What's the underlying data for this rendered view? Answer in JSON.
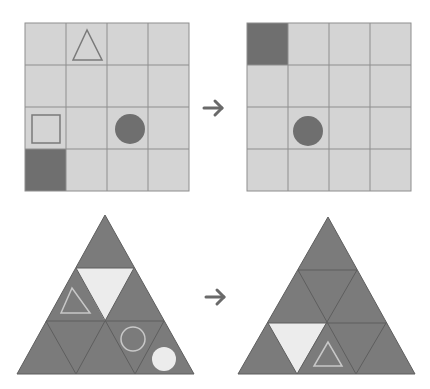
{
  "colors": {
    "background": "#ffffff",
    "grid_cell": "#d4d4d4",
    "grid_line": "#8e8e8e",
    "dark_fill": "#6f6f6f",
    "shape_outline": "#7a7a7a",
    "tri_fill": "#7b7b7b",
    "tri_line": "#5e5e5e",
    "light_fill": "#ececec",
    "light_outline": "#c8c8c8",
    "arrow": "#6a6a6a"
  },
  "top_row": {
    "before": {
      "grid_size": 4,
      "items": [
        {
          "type": "triangle-outline",
          "row": 0,
          "col": 1
        },
        {
          "type": "square-outline",
          "row": 2,
          "col": 0
        },
        {
          "type": "circle-filled",
          "row": 2,
          "col": 2
        },
        {
          "type": "cell-filled",
          "row": 3,
          "col": 0
        }
      ]
    },
    "after": {
      "grid_size": 4,
      "items": [
        {
          "type": "cell-filled",
          "row": 0,
          "col": 0
        },
        {
          "type": "circle-filled",
          "row": 2,
          "col": 1
        }
      ]
    },
    "arrow": "right-arrow"
  },
  "bottom_row": {
    "before": {
      "rows": 3,
      "items": [
        {
          "type": "light-triangle",
          "row": 1,
          "index": 1
        },
        {
          "type": "triangle-outline",
          "row": 1,
          "index": 0
        },
        {
          "type": "circle-outline",
          "row": 2,
          "index": 3
        },
        {
          "type": "circle-filled-light",
          "row": 2,
          "index": 4
        }
      ]
    },
    "after": {
      "rows": 3,
      "items": [
        {
          "type": "light-triangle",
          "row": 2,
          "index": 1
        },
        {
          "type": "triangle-outline",
          "row": 2,
          "index": 2
        }
      ]
    },
    "arrow": "right-arrow"
  }
}
